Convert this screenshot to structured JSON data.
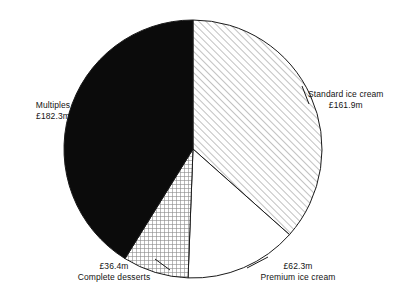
{
  "chart_data": {
    "type": "pie",
    "title": "",
    "subtitle": "",
    "xlabel": "",
    "ylabel": "",
    "currency": "£",
    "unit_suffix": "m",
    "legend_position": "none",
    "grid": false,
    "total": 442.9,
    "categories": [
      "Standard ice cream",
      "Premium ice cream",
      "Complete desserts",
      "Multiples"
    ],
    "values": [
      161.9,
      62.3,
      36.4,
      182.3
    ],
    "slices": [
      {
        "name": "Standard ice cream",
        "value": 161.9,
        "value_label": "£161.9m",
        "percent": 36.6,
        "start_angle": 0.0,
        "end_angle": 131.6,
        "fill": "diagonal-hatch",
        "fill_color": "#ffffff",
        "stroke_color": "#1a1a1a"
      },
      {
        "name": "Premium ice cream",
        "value": 62.3,
        "value_label": "£62.3m",
        "percent": 14.1,
        "start_angle": 131.6,
        "end_angle": 182.2,
        "fill": "solid-white",
        "fill_color": "#ffffff",
        "stroke_color": "#1a1a1a"
      },
      {
        "name": "Complete desserts",
        "value": 36.4,
        "value_label": "£36.4m",
        "percent": 8.2,
        "start_angle": 182.2,
        "end_angle": 211.8,
        "fill": "cross-hatch",
        "fill_color": "#ffffff",
        "stroke_color": "#1a1a1a"
      },
      {
        "name": "Multiples",
        "value": 182.3,
        "value_label": "£182.3m",
        "percent": 41.2,
        "start_angle": 211.8,
        "end_angle": 360.0,
        "fill": "solid-black",
        "fill_color": "#0b0b0b",
        "stroke_color": "#1a1a1a"
      }
    ],
    "geometry": {
      "center_x": 193,
      "center_y": 149,
      "radius": 129
    }
  },
  "labels": {
    "standard": {
      "name": "Standard ice cream",
      "value": "£161.9m"
    },
    "premium": {
      "name": "Premium ice cream",
      "value": "£62.3m"
    },
    "desserts": {
      "name": "Complete desserts",
      "value": "£36.4m"
    },
    "multiples": {
      "name": "Multiples",
      "value": "£182.3m"
    }
  }
}
